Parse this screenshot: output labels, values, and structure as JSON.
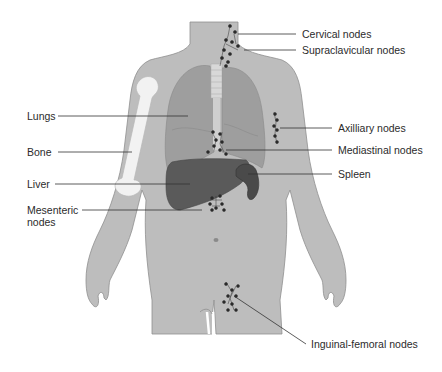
{
  "figure": {
    "colors": {
      "skin": "#bdbdbd",
      "skin_outline": "#8f8f8f",
      "lungs": "#9e9e9e",
      "liver": "#5a5a5a",
      "spleen": "#4a4a4a",
      "bone": "#f2f2f2",
      "node": "#2a2a2a"
    },
    "labels_left": [
      {
        "id": "lungs",
        "text": "Lungs"
      },
      {
        "id": "bone",
        "text": "Bone"
      },
      {
        "id": "liver",
        "text": "Liver"
      },
      {
        "id": "mesenteric",
        "text": "Mesenteric",
        "text2": "nodes"
      }
    ],
    "labels_right": [
      {
        "id": "cervical",
        "text": "Cervical nodes"
      },
      {
        "id": "supraclavicular",
        "text": "Supraclavicular nodes"
      },
      {
        "id": "axillary",
        "text": "Axilliary nodes"
      },
      {
        "id": "mediastinal",
        "text": "Mediastinal nodes"
      },
      {
        "id": "spleen",
        "text": "Spleen"
      },
      {
        "id": "inguinal",
        "text": "Inguinal-femoral nodes"
      }
    ]
  }
}
